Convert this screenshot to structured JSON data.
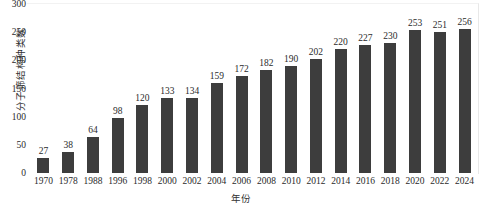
{
  "chart_data": {
    "type": "bar",
    "title": "",
    "xlabel": "年份",
    "ylabel": "分子筛结构种类数",
    "categories": [
      "1970",
      "1978",
      "1988",
      "1996",
      "1998",
      "2000",
      "2002",
      "2004",
      "2006",
      "2008",
      "2010",
      "2012",
      "2014",
      "2016",
      "2018",
      "2020",
      "2022",
      "2024"
    ],
    "values": [
      27,
      38,
      64,
      98,
      120,
      133,
      134,
      159,
      172,
      182,
      190,
      202,
      220,
      227,
      230,
      253,
      251,
      256
    ],
    "ylim": [
      0,
      300
    ],
    "yticks": [
      "0",
      "50",
      "100",
      "150",
      "200",
      "250",
      "300"
    ],
    "ytick_values": [
      0,
      50,
      100,
      150,
      200,
      250,
      300
    ],
    "grid": false,
    "legend": false,
    "data_labels": [
      "27",
      "38",
      "64",
      "98",
      "120",
      "133",
      "134",
      "159",
      "172",
      "182",
      "190",
      "202",
      "220",
      "227",
      "230",
      "253",
      "251",
      "256"
    ],
    "bar_color": "#3d3d3d",
    "background_color": "#ffffff",
    "text_color": "#2b2b2b"
  }
}
